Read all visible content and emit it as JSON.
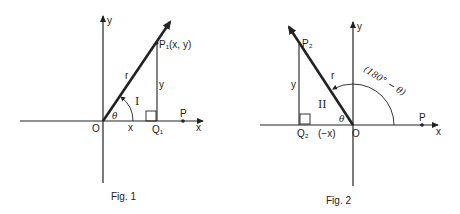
{
  "figures": [
    {
      "caption": "Fig. 1",
      "labels": {
        "y_axis": "y",
        "x_axis": "x",
        "origin": "O",
        "point": "P₁(x, y)",
        "foot": "Q₁",
        "radius": "r",
        "opposite": "y",
        "adjacent": "x",
        "angle": "θ",
        "quadrant": "I",
        "ref_point": "P"
      }
    },
    {
      "caption": "Fig. 2",
      "labels": {
        "y_axis": "y",
        "x_axis": "x",
        "origin": "O",
        "point": "P₂",
        "foot": "Q₂",
        "radius": "r",
        "opposite": "y",
        "adjacent": "(−x)",
        "angle": "θ",
        "angle_outer": "(180° − θ)",
        "quadrant": "II",
        "ref_point": "P"
      }
    }
  ],
  "colors": {
    "ink": "#222222",
    "background": "#ffffff"
  }
}
